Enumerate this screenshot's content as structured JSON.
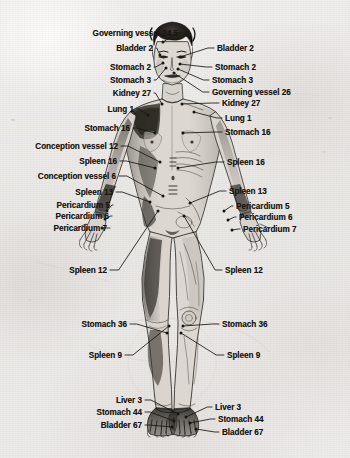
{
  "diagram": {
    "background_color": "#eceae8",
    "ink_color": "#17150f",
    "view": "front"
  },
  "labels": {
    "left": [
      {
        "text": "Governing vessel 24.5",
        "x": 178,
        "y": 33,
        "point_x": 163,
        "point_y": 42
      },
      {
        "text": "Bladder 2",
        "x": 153,
        "y": 48,
        "point_x": 160,
        "point_y": 55
      },
      {
        "text": "Stomach 2",
        "x": 151,
        "y": 67,
        "point_x": 163,
        "point_y": 63
      },
      {
        "text": "Stomach 3",
        "x": 151,
        "y": 80,
        "point_x": 166,
        "point_y": 68
      },
      {
        "text": "Kidney 27",
        "x": 151,
        "y": 93,
        "point_x": 162,
        "point_y": 104
      },
      {
        "text": "Lung 1",
        "x": 134,
        "y": 109,
        "point_x": 148,
        "point_y": 115
      },
      {
        "text": "Stomach 16",
        "x": 130,
        "y": 128,
        "point_x": 155,
        "point_y": 133
      },
      {
        "text": "Conception vessel 12",
        "x": 118,
        "y": 146,
        "point_x": 160,
        "point_y": 162
      },
      {
        "text": "Spleen 16",
        "x": 117,
        "y": 161,
        "point_x": 155,
        "point_y": 168
      },
      {
        "text": "Conception vessel 6",
        "x": 116,
        "y": 176,
        "point_x": 163,
        "point_y": 196
      },
      {
        "text": "Spleen 13",
        "x": 113,
        "y": 192,
        "point_x": 150,
        "point_y": 202
      },
      {
        "text": "Pericardium 5",
        "x": 110,
        "y": 205,
        "point_x": 107,
        "point_y": 211
      },
      {
        "text": "Pericardium 6",
        "x": 109,
        "y": 216,
        "point_x": 105,
        "point_y": 219
      },
      {
        "text": "Pericardium 7",
        "x": 107,
        "y": 228,
        "point_x": 102,
        "point_y": 228
      },
      {
        "text": "Spleen 12",
        "x": 107,
        "y": 270,
        "point_x": 158,
        "point_y": 211
      },
      {
        "text": "Stomach 36",
        "x": 127,
        "y": 324,
        "point_x": 167,
        "point_y": 333
      },
      {
        "text": "Spleen 9",
        "x": 122,
        "y": 355,
        "point_x": 169,
        "point_y": 326
      },
      {
        "text": "Liver 3",
        "x": 142,
        "y": 400,
        "point_x": 178,
        "point_y": 414
      },
      {
        "text": "Stomach 44",
        "x": 142,
        "y": 412,
        "point_x": 174,
        "point_y": 421
      },
      {
        "text": "Bladder 67",
        "x": 142,
        "y": 425,
        "point_x": 172,
        "point_y": 427
      }
    ],
    "right": [
      {
        "text": "Bladder 2",
        "x": 217,
        "y": 48,
        "point_x": 180,
        "point_y": 57
      },
      {
        "text": "Stomach 2",
        "x": 215,
        "y": 67,
        "point_x": 180,
        "point_y": 64
      },
      {
        "text": "Stomach 3",
        "x": 212,
        "y": 80,
        "point_x": 178,
        "point_y": 69
      },
      {
        "text": "Governing vessel 26",
        "x": 212,
        "y": 92,
        "point_x": 174,
        "point_y": 73
      },
      {
        "text": "Kidney 27",
        "x": 222,
        "y": 103,
        "point_x": 182,
        "point_y": 104
      },
      {
        "text": "Lung 1",
        "x": 225,
        "y": 118,
        "point_x": 194,
        "point_y": 112
      },
      {
        "text": "Stomach 16",
        "x": 225,
        "y": 132,
        "point_x": 183,
        "point_y": 133
      },
      {
        "text": "Spleen 16",
        "x": 227,
        "y": 162,
        "point_x": 178,
        "point_y": 168
      },
      {
        "text": "Spleen 13",
        "x": 229,
        "y": 191,
        "point_x": 190,
        "point_y": 203
      },
      {
        "text": "Pericardium 5",
        "x": 236,
        "y": 206,
        "point_x": 224,
        "point_y": 211
      },
      {
        "text": "Pericardium 6",
        "x": 239,
        "y": 217,
        "point_x": 228,
        "point_y": 220
      },
      {
        "text": "Pericardium 7",
        "x": 243,
        "y": 229,
        "point_x": 232,
        "point_y": 230
      },
      {
        "text": "Spleen 12",
        "x": 225,
        "y": 270,
        "point_x": 184,
        "point_y": 216
      },
      {
        "text": "Stomach 36",
        "x": 222,
        "y": 324,
        "point_x": 183,
        "point_y": 326
      },
      {
        "text": "Spleen 9",
        "x": 227,
        "y": 355,
        "point_x": 181,
        "point_y": 333
      },
      {
        "text": "Liver 3",
        "x": 215,
        "y": 407,
        "point_x": 186,
        "point_y": 417
      },
      {
        "text": "Stomach 44",
        "x": 218,
        "y": 419,
        "point_x": 190,
        "point_y": 423
      },
      {
        "text": "Bladder 67",
        "x": 222,
        "y": 432,
        "point_x": 196,
        "point_y": 429
      }
    ]
  }
}
